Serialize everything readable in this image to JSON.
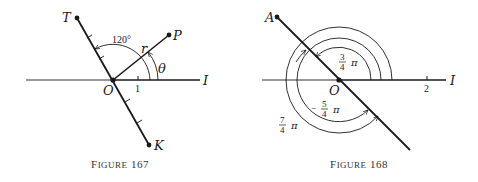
{
  "figures": [
    {
      "caption": {
        "prefix": "F",
        "rest": "IGURE",
        "number": "167"
      },
      "labels": {
        "T": "T",
        "P": "P",
        "K": "K",
        "O": "O",
        "I": "I",
        "r": "r",
        "theta": "θ",
        "angle": "120°",
        "unit_tick": "1"
      },
      "colors": {
        "ink": "#1a1a1a",
        "background": "#ffffff"
      }
    },
    {
      "caption": {
        "prefix": "F",
        "rest": "IGURE",
        "number": "168"
      },
      "labels": {
        "A": "A",
        "O": "O",
        "I": "I",
        "unit_tick": "2",
        "arc_inner": {
          "sign": "",
          "num": "3",
          "den": "4",
          "pi": "π"
        },
        "arc_middle": {
          "sign": "−",
          "num": "5",
          "den": "4",
          "pi": "π"
        },
        "arc_outer": {
          "sign": "",
          "num": "7",
          "den": "4",
          "pi": "π"
        }
      },
      "colors": {
        "ink": "#1a1a1a",
        "background": "#ffffff"
      }
    }
  ]
}
